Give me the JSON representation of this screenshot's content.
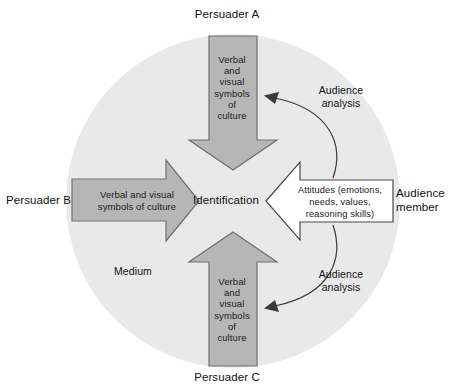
{
  "diagram": {
    "title_model": "Persuasion / Identification Model",
    "colors": {
      "medium_circle": "#e9e9e9",
      "arrow_fill": "#b6b6b6",
      "arrow_stroke": "#6f6f6f",
      "open_arrow_fill": "#ffffff",
      "open_arrow_stroke": "#4a4a4a",
      "curve_stroke": "#3a3a3a",
      "text": "#111111",
      "background": "#ffffff"
    },
    "medium": {
      "label": "Medium",
      "shape": "circle"
    },
    "center": {
      "label": "Identification"
    },
    "sources": [
      {
        "id": "persuader-a",
        "label": "Persuader A",
        "position": "top",
        "arrow_direction": "down",
        "arrow_style": "filled",
        "message": "Verbal\nand\nvisual\nsymbols\nof\nculture"
      },
      {
        "id": "persuader-b",
        "label": "Persuader B",
        "position": "left",
        "arrow_direction": "right",
        "arrow_style": "filled",
        "message": "Verbal and visual\nsymbols of culture"
      },
      {
        "id": "persuader-c",
        "label": "Persuader C",
        "position": "bottom",
        "arrow_direction": "up",
        "arrow_style": "filled",
        "message": "Verbal\nand\nvisual\nsymbols\nof\nculture"
      }
    ],
    "receiver": {
      "id": "audience-member",
      "label": "Audience\nmember",
      "position": "right",
      "arrow_direction": "left",
      "arrow_style": "outline",
      "message": "Attitudes (emotions,\nneeds, values,\nreasoning skills)"
    },
    "feedback": [
      {
        "id": "audience-analysis-top",
        "label": "Audience\nanalysis",
        "from": "audience-member",
        "to": "persuader-a"
      },
      {
        "id": "audience-analysis-bottom",
        "label": "Audience\nanalysis",
        "from": "audience-member",
        "to": "persuader-c"
      }
    ]
  }
}
